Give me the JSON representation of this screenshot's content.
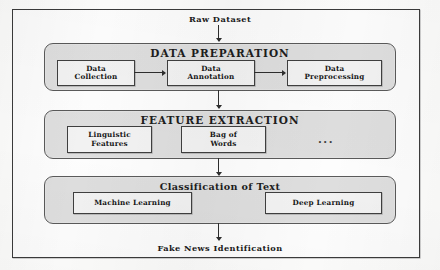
{
  "figure": {
    "input_label": "Raw Dataset",
    "output_label": "Fake News Identification",
    "ellipsis": "...",
    "colors": {
      "panel_fill": "#dedede",
      "panel_border": "#5a5a5a",
      "box_fill": "#f2f2f2",
      "box_border": "#3f3f3f",
      "arrow": "#2e2e2e",
      "frame": "#3b3b3b",
      "page": "#fdfdfd"
    },
    "stages": [
      {
        "title": "DATA PREPARATION",
        "boxes": [
          {
            "label": "Data\nCollection"
          },
          {
            "label": "Data\nAnnotation"
          },
          {
            "label": "Data\nPreprocessing"
          }
        ]
      },
      {
        "title": "FEATURE EXTRACTION",
        "boxes": [
          {
            "label": "Linguistic\nFeatures"
          },
          {
            "label": "Bag of\nWords"
          }
        ]
      },
      {
        "title": "Classification of Text",
        "boxes": [
          {
            "label": "Machine Learning"
          },
          {
            "label": "Deep Learning"
          }
        ]
      }
    ]
  }
}
